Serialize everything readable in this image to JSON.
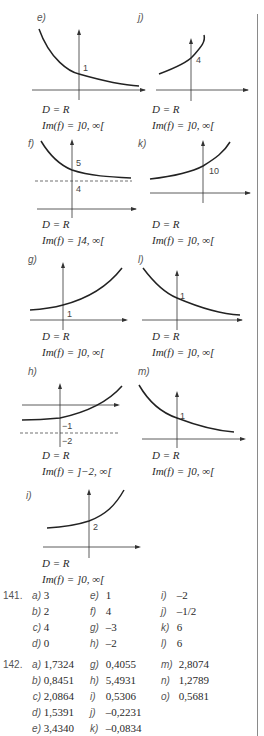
{
  "graphs": {
    "e": {
      "label": "e)",
      "tick": "1",
      "domain": "D = R",
      "image": "Im(f) = ]0, ∞["
    },
    "j": {
      "label": "j)",
      "tick": "4",
      "domain": "D = R",
      "image": "Im(f) = ]0, ∞["
    },
    "f": {
      "label": "f)",
      "tick_top": "5",
      "tick_bottom": "4",
      "domain": "D = R",
      "image": "Im(f) = ]4, ∞["
    },
    "k": {
      "label": "k)",
      "tick": "10",
      "domain": "D = R",
      "image": "Im(f) = ]0, ∞["
    },
    "g": {
      "label": "g)",
      "tick": "1",
      "domain": "D = R",
      "image": "Im(f) = ]0, ∞["
    },
    "l": {
      "label": "l)",
      "tick": "1",
      "domain": "D = R",
      "image": "Im(f) = ]0, ∞["
    },
    "h": {
      "label": "h)",
      "tick_top": "−1",
      "tick_bottom": "−2",
      "domain": "D = R",
      "image": "Im(f) = ]−2, ∞["
    },
    "m": {
      "label": "m)",
      "tick": "1",
      "domain": "D = R",
      "image": "Im(f) = ]0, ∞["
    },
    "i": {
      "label": "i)",
      "tick": "2",
      "domain": "D = R",
      "image": "Im(f) = ]0, ∞["
    }
  },
  "ex141": {
    "number": "141.",
    "col1": [
      {
        "k": "a)",
        "v": "3"
      },
      {
        "k": "b)",
        "v": "2"
      },
      {
        "k": "c)",
        "v": "4"
      },
      {
        "k": "d)",
        "v": "0"
      }
    ],
    "col2": [
      {
        "k": "e)",
        "v": "1"
      },
      {
        "k": "f)",
        "v": "4"
      },
      {
        "k": "g)",
        "v": "–3"
      },
      {
        "k": "h)",
        "v": "–2"
      }
    ],
    "col3": [
      {
        "k": "i)",
        "v": "–2"
      },
      {
        "k": "j)",
        "v": "–1/2"
      },
      {
        "k": "k)",
        "v": "6"
      },
      {
        "k": "l)",
        "v": "6"
      }
    ]
  },
  "ex142": {
    "number": "142.",
    "col1": [
      {
        "k": "a)",
        "v": "1,7324"
      },
      {
        "k": "b)",
        "v": "0,8451"
      },
      {
        "k": "c)",
        "v": "2,0864"
      },
      {
        "k": "d)",
        "v": "1,5391"
      },
      {
        "k": "e)",
        "v": "3,4340"
      }
    ],
    "col2": [
      {
        "k": "g)",
        "v": "0,4055"
      },
      {
        "k": "h)",
        "v": "5,4931"
      },
      {
        "k": "i)",
        "v": "0,5306"
      },
      {
        "k": "j)",
        "v": "–0,2231"
      },
      {
        "k": "k)",
        "v": "–0,0834"
      }
    ],
    "col3": [
      {
        "k": "m)",
        "v": "2,8074"
      },
      {
        "k": "n)",
        "v": "1,2789"
      },
      {
        "k": "o)",
        "v": "0,5681"
      }
    ]
  }
}
